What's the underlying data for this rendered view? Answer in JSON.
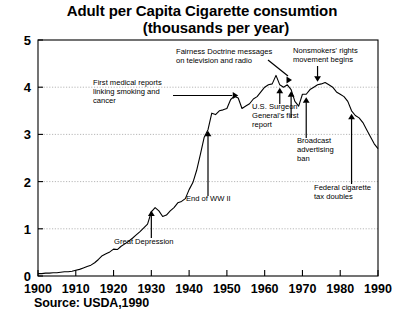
{
  "title": {
    "line1": "Adult per Capita Cigarette consumtion",
    "line2": "(thousands per year)"
  },
  "source": "Source: USDA,1990",
  "chart_data": {
    "type": "line",
    "title": "Adult per Capita Cigarette consumtion (thousands per year)",
    "xlabel": "",
    "ylabel": "",
    "xlim": [
      1900,
      1990
    ],
    "ylim": [
      0,
      5
    ],
    "xticks": [
      "1900",
      "1910",
      "1920",
      "1930",
      "1940",
      "1950",
      "1960",
      "1970",
      "1980",
      "1990"
    ],
    "yticks": [
      "0",
      "1",
      "2",
      "3",
      "4",
      "5"
    ],
    "grid": "horizontal-dotted",
    "legend": "none",
    "series": [
      {
        "name": "Adult per capita cigarette consumption",
        "x": [
          1900,
          1901,
          1902,
          1903,
          1904,
          1905,
          1906,
          1907,
          1908,
          1909,
          1910,
          1911,
          1912,
          1913,
          1914,
          1915,
          1916,
          1917,
          1918,
          1919,
          1920,
          1921,
          1922,
          1923,
          1924,
          1925,
          1926,
          1927,
          1928,
          1929,
          1930,
          1931,
          1932,
          1933,
          1934,
          1935,
          1936,
          1937,
          1938,
          1939,
          1940,
          1941,
          1942,
          1943,
          1944,
          1945,
          1946,
          1947,
          1948,
          1949,
          1950,
          1951,
          1952,
          1953,
          1954,
          1955,
          1956,
          1957,
          1958,
          1959,
          1960,
          1961,
          1962,
          1963,
          1964,
          1965,
          1966,
          1967,
          1968,
          1969,
          1970,
          1971,
          1972,
          1973,
          1974,
          1975,
          1976,
          1977,
          1978,
          1979,
          1980,
          1981,
          1982,
          1983,
          1984,
          1985,
          1986,
          1987,
          1988,
          1989,
          1990
        ],
        "y": [
          0.05,
          0.05,
          0.06,
          0.06,
          0.07,
          0.07,
          0.08,
          0.09,
          0.09,
          0.1,
          0.12,
          0.14,
          0.17,
          0.2,
          0.23,
          0.28,
          0.35,
          0.43,
          0.47,
          0.51,
          0.57,
          0.56,
          0.63,
          0.68,
          0.74,
          0.8,
          0.87,
          0.94,
          1.02,
          1.1,
          1.36,
          1.45,
          1.38,
          1.26,
          1.29,
          1.38,
          1.45,
          1.55,
          1.58,
          1.64,
          1.83,
          1.98,
          2.24,
          2.58,
          2.94,
          3.1,
          3.45,
          3.42,
          3.5,
          3.52,
          3.55,
          3.74,
          3.81,
          3.77,
          3.55,
          3.6,
          3.65,
          3.75,
          3.8,
          3.9,
          4.0,
          4.05,
          4.07,
          4.25,
          4.05,
          4.0,
          4.05,
          3.95,
          3.7,
          3.6,
          3.85,
          3.85,
          3.95,
          4.0,
          4.05,
          4.07,
          4.1,
          4.05,
          4.0,
          3.9,
          3.85,
          3.8,
          3.7,
          3.5,
          3.4,
          3.35,
          3.25,
          3.1,
          2.95,
          2.8,
          2.7
        ]
      }
    ],
    "annotations": [
      {
        "id": "first-medical-reports",
        "lines": [
          "First medical reports",
          "linking smoking and",
          "cancer"
        ],
        "year": 1953,
        "value": 3.85,
        "leader": "horizontal-arrow-right"
      },
      {
        "id": "great-depression",
        "lines": [
          "Great Depression"
        ],
        "year": 1930,
        "value": 1.45,
        "leader": "vertical-arrow-up"
      },
      {
        "id": "end-of-ww2",
        "lines": [
          "End of WW II"
        ],
        "year": 1945,
        "value": 3.2,
        "leader": "vertical-arrow-up"
      },
      {
        "id": "fairness-doctrine",
        "lines": [
          "Fairness Doctrine messages",
          "on television and radio"
        ],
        "year": 1967,
        "value": 3.98,
        "leader": "vertical-arrow-up-with-diagonal"
      },
      {
        "id": "us-surgeon-general-report",
        "lines": [
          "U.S. Surgeon",
          "General's first",
          "report"
        ],
        "year": 1964,
        "value": 4.05,
        "leader": "vertical-arrow-up"
      },
      {
        "id": "nonsmokers-rights",
        "lines": [
          "Nonsmokers' rights",
          "movement begins"
        ],
        "year": 1974,
        "value": 4.05,
        "leader": "vertical-arrow-down"
      },
      {
        "id": "broadcast-advertising-ban",
        "lines": [
          "Broadcast",
          "advertising",
          "ban"
        ],
        "year": 1971,
        "value": 3.85,
        "leader": "vertical-arrow-up"
      },
      {
        "id": "federal-cigarette-tax-doubles",
        "lines": [
          "Federal cigarette",
          "tax doubles"
        ],
        "year": 1983,
        "value": 3.5,
        "leader": "vertical-arrow-up"
      }
    ]
  }
}
